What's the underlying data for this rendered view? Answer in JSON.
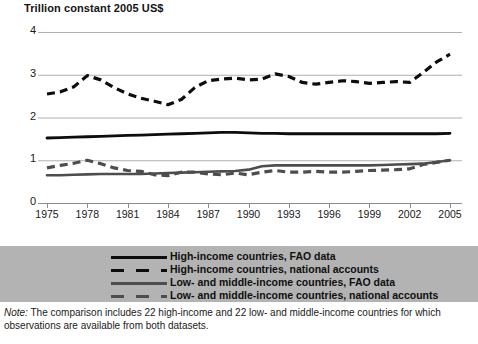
{
  "axis_title": "Trillion constant 2005 US$",
  "legend": {
    "items": [
      {
        "label": "High-income countries, FAO data",
        "style": "solid",
        "color": "#0d0d0d"
      },
      {
        "label": "High-income countries, national accounts",
        "style": "dashed",
        "color": "#0d0d0d"
      },
      {
        "label": "Low- and middle-income countries, FAO data",
        "style": "solid",
        "color": "#4d4d4d"
      },
      {
        "label": "Low- and middle-income countries, national accounts",
        "style": "dashed",
        "color": "#4d4d4d"
      }
    ]
  },
  "note": {
    "lead": "Note:",
    "text": " The comparison includes 22  high-income and 22 low- and middle-income countries for which observations are available from both datasets."
  },
  "chart_data": {
    "type": "line",
    "title": "",
    "subtitle": "",
    "xlabel": "",
    "ylabel": "Trillion constant 2005 US$",
    "xlim": [
      1975,
      2005
    ],
    "ylim": [
      0,
      4
    ],
    "yticks": [
      0,
      1,
      2,
      3,
      4
    ],
    "ytick_labels": [
      "0",
      "1",
      "2",
      "3",
      "4"
    ],
    "xticks": [
      1975,
      1978,
      1981,
      1984,
      1987,
      1990,
      1993,
      1996,
      1999,
      2002,
      2005
    ],
    "xtick_labels": [
      "1975",
      "1978",
      "1981",
      "1984",
      "1987",
      "1990",
      "1993",
      "1996",
      "1999",
      "2002",
      "2005"
    ],
    "grid": "horizontal",
    "legend_position": "below",
    "x": [
      1975,
      1976,
      1977,
      1978,
      1979,
      1980,
      1981,
      1982,
      1983,
      1984,
      1985,
      1986,
      1987,
      1988,
      1989,
      1990,
      1991,
      1992,
      1993,
      1994,
      1995,
      1996,
      1997,
      1998,
      1999,
      2000,
      2001,
      2002,
      2003,
      2004,
      2005
    ],
    "series": [
      {
        "name": "High-income countries, FAO data",
        "style": "solid",
        "color": "#0d0d0d",
        "values": [
          1.52,
          1.53,
          1.54,
          1.55,
          1.56,
          1.57,
          1.58,
          1.59,
          1.6,
          1.61,
          1.62,
          1.63,
          1.64,
          1.65,
          1.65,
          1.64,
          1.63,
          1.63,
          1.62,
          1.62,
          1.62,
          1.62,
          1.62,
          1.62,
          1.62,
          1.62,
          1.62,
          1.62,
          1.62,
          1.62,
          1.63
        ]
      },
      {
        "name": "High-income countries, national accounts",
        "style": "dashed",
        "color": "#0d0d0d",
        "values": [
          2.55,
          2.6,
          2.72,
          2.98,
          2.88,
          2.7,
          2.55,
          2.45,
          2.38,
          2.3,
          2.42,
          2.7,
          2.86,
          2.9,
          2.92,
          2.88,
          2.9,
          3.02,
          2.96,
          2.82,
          2.78,
          2.82,
          2.86,
          2.84,
          2.8,
          2.82,
          2.84,
          2.82,
          3.05,
          3.3,
          3.48
        ]
      },
      {
        "name": "Low- and middle-income countries, FAO data",
        "style": "solid",
        "color": "#4d4d4d",
        "values": [
          0.65,
          0.65,
          0.66,
          0.67,
          0.68,
          0.68,
          0.68,
          0.68,
          0.69,
          0.7,
          0.71,
          0.72,
          0.73,
          0.74,
          0.75,
          0.78,
          0.86,
          0.88,
          0.88,
          0.88,
          0.88,
          0.88,
          0.88,
          0.88,
          0.88,
          0.89,
          0.9,
          0.91,
          0.92,
          0.96,
          1.0
        ]
      },
      {
        "name": "Low- and middle-income countries, national accounts",
        "style": "dashed",
        "color": "#4d4d4d",
        "values": [
          0.82,
          0.88,
          0.93,
          1.0,
          0.92,
          0.82,
          0.76,
          0.74,
          0.66,
          0.64,
          0.72,
          0.72,
          0.68,
          0.66,
          0.7,
          0.66,
          0.72,
          0.76,
          0.72,
          0.72,
          0.74,
          0.72,
          0.72,
          0.74,
          0.76,
          0.77,
          0.78,
          0.8,
          0.9,
          0.95,
          1.0
        ]
      }
    ]
  }
}
